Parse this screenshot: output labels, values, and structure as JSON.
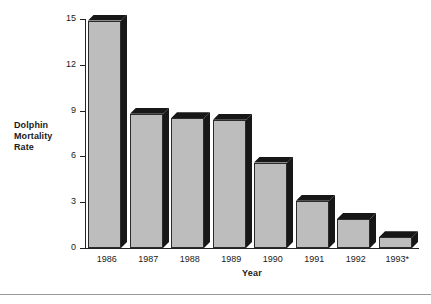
{
  "chart_data": {
    "type": "bar",
    "title": "",
    "subtitle": "",
    "xlabel": "Year",
    "ylabel": "Dolphin Mortality Rate",
    "ylabel_lines": [
      "Dolphin",
      "Mortality",
      "Rate"
    ],
    "categories": [
      "1986",
      "1987",
      "1988",
      "1989",
      "1990",
      "1991",
      "1992",
      "1993*"
    ],
    "values": [
      14.9,
      8.8,
      8.5,
      8.4,
      5.6,
      3.1,
      1.9,
      0.7
    ],
    "ylim": [
      0,
      15
    ],
    "yticks": [
      0,
      3,
      6,
      9,
      12,
      15
    ],
    "ytick_labels": [
      "0",
      "3",
      "6",
      "9",
      "12",
      "15"
    ],
    "grid": false,
    "legend": false,
    "legend_position": "none",
    "bar_style": "3d-shadow",
    "bar_fill_color": "#bdbdbd",
    "bar_shadow_color": "#171717",
    "bar_outline_color": "#2b2b2b",
    "axis_color": "#222222",
    "background_color": "#ffffff",
    "annotations": [
      "1993 value marked with an asterisk"
    ]
  },
  "axes": {
    "y_title_line1": "Dolphin",
    "y_title_line2": "Mortality",
    "y_title_line3": "Rate",
    "x_title": "Year"
  },
  "ticks": {
    "y": [
      "15",
      "12",
      "9",
      "6",
      "3",
      "0"
    ],
    "x": [
      "1986",
      "1987",
      "1988",
      "1989",
      "1990",
      "1991",
      "1992",
      "1993*"
    ]
  }
}
